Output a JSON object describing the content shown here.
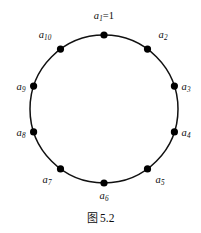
{
  "figure": {
    "caption_prefix": "图",
    "caption_number": "5.2",
    "caption_full": "图 5.2",
    "background_color": "#ffffff",
    "ink_color": "#0d0d0d"
  },
  "diagram": {
    "type": "cycle-graph",
    "shape": "circle",
    "center_x": 104,
    "center_y": 109,
    "radius": 74,
    "stroke_color": "#111111",
    "stroke_width": 1.5,
    "node_count": 10,
    "node_radius": 3.6,
    "node_fill": "#000000",
    "start_angle_deg": -90,
    "step_angle_deg": 36,
    "direction": "clockwise"
  },
  "nodes": [
    {
      "id": "a1",
      "base": "a",
      "subscript": "1",
      "suffix": "=1",
      "angle_deg": -90,
      "cx": 104,
      "cy": 35,
      "label_x": 104,
      "label_y": 17,
      "label_text": "a₁=1"
    },
    {
      "id": "a2",
      "base": "a",
      "subscript": "2",
      "suffix": "",
      "angle_deg": -54,
      "cx": 147.5,
      "cy": 49.1,
      "label_x": 163,
      "label_y": 36,
      "label_text": "a₂"
    },
    {
      "id": "a3",
      "base": "a",
      "subscript": "3",
      "suffix": "",
      "angle_deg": -18,
      "cx": 174.4,
      "cy": 86.1,
      "label_x": 186,
      "label_y": 88,
      "label_text": "a₃"
    },
    {
      "id": "a4",
      "base": "a",
      "subscript": "4",
      "suffix": "",
      "angle_deg": 18,
      "cx": 174.4,
      "cy": 131.9,
      "label_x": 186,
      "label_y": 134,
      "label_text": "a₄"
    },
    {
      "id": "a5",
      "base": "a",
      "subscript": "5",
      "suffix": "",
      "angle_deg": 54,
      "cx": 147.5,
      "cy": 168.9,
      "label_x": 160,
      "label_y": 181,
      "label_text": "a₅"
    },
    {
      "id": "a6",
      "base": "a",
      "subscript": "6",
      "suffix": "",
      "angle_deg": 90,
      "cx": 104,
      "cy": 183,
      "label_x": 104,
      "label_y": 197,
      "label_text": "a₆"
    },
    {
      "id": "a7",
      "base": "a",
      "subscript": "7",
      "suffix": "",
      "angle_deg": 126,
      "cx": 60.5,
      "cy": 168.9,
      "label_x": 47,
      "label_y": 181,
      "label_text": "a₇"
    },
    {
      "id": "a8",
      "base": "a",
      "subscript": "8",
      "suffix": "",
      "angle_deg": 162,
      "cx": 33.6,
      "cy": 131.9,
      "label_x": 21,
      "label_y": 134,
      "label_text": "a₈"
    },
    {
      "id": "a9",
      "base": "a",
      "subscript": "9",
      "suffix": "",
      "angle_deg": 198,
      "cx": 33.6,
      "cy": 86.1,
      "label_x": 21,
      "label_y": 88,
      "label_text": "a₉"
    },
    {
      "id": "a10",
      "base": "a",
      "subscript": "10",
      "suffix": "",
      "angle_deg": 234,
      "cx": 60.5,
      "cy": 49.1,
      "label_x": 45,
      "label_y": 36,
      "label_text": "a₁₀"
    }
  ],
  "caption_position": {
    "x": 0,
    "y": 209
  }
}
